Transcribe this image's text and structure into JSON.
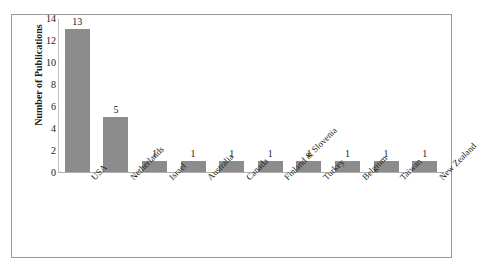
{
  "chart_data": {
    "type": "bar",
    "title": "",
    "subtitle": "",
    "xlabel": "",
    "ylabel": "Number of Publications",
    "categories": [
      "USA",
      "Netherlands",
      "Israel",
      "Australia",
      "Canada",
      "Finland & Slovenia",
      "Turkey",
      "Belgium",
      "Taiwan",
      "New Zealand"
    ],
    "values": [
      13,
      5,
      1,
      1,
      1,
      1,
      1,
      1,
      1,
      1
    ],
    "data_labels": [
      "13",
      "5",
      "1",
      "1",
      "1",
      "1",
      "1",
      "1",
      "1",
      "1"
    ],
    "ylim": [
      0,
      14
    ],
    "ytick_step": 2,
    "yticks": [
      "14",
      "12",
      "10",
      "8",
      "6",
      "4",
      "2",
      "0"
    ],
    "grid": false,
    "legend": false,
    "legend_position": "none",
    "bar_color": "#8c8c8c",
    "axis_color": "#b0b0b0",
    "frame_color": "#9a9a9a",
    "text_color": "#1a1a1a",
    "background": "#ffffff",
    "xlabel_rotation_deg": -45
  }
}
